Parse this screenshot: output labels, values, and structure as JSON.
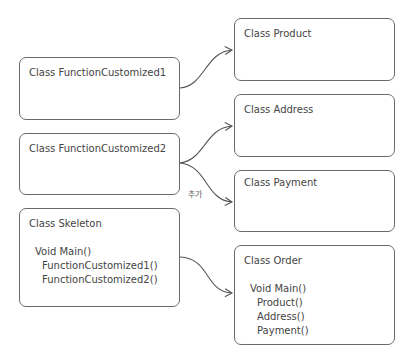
{
  "left_boxes": {
    "fc1": {
      "title": "Class  FunctionCustomized1"
    },
    "fc2": {
      "title": "Class  FunctionCustomized2"
    },
    "skeleton": {
      "title": "Class Skeleton",
      "method": "Void Main()",
      "calls": [
        "FunctionCustomized1()",
        "FunctionCustomized2()"
      ]
    }
  },
  "right_boxes": {
    "product": {
      "title": "Class  Product"
    },
    "address": {
      "title": "Class  Address"
    },
    "payment": {
      "title": "Class  Payment"
    },
    "order": {
      "title": "Class Order",
      "method": "Void Main()",
      "calls": [
        "Product()",
        "Address()",
        "Payment()"
      ]
    }
  },
  "connector_label": "추가",
  "colors": {
    "stroke": "#6b6b6b",
    "text": "#444444"
  }
}
